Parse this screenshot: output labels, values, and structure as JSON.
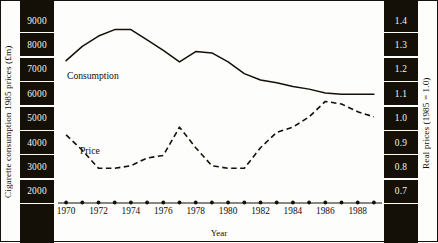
{
  "axes": {
    "left_title": "Cigarette consumption 1985 prices (£m)",
    "right_title": "Real prices (1985 = 1.0)",
    "x_title": "Year"
  },
  "labels": {
    "consumption": "Consumption",
    "price": "Price"
  },
  "ticks": {
    "left": [
      "9000",
      "8000",
      "7000",
      "6000",
      "5000",
      "4000",
      "3000",
      "2000"
    ],
    "right": [
      "1.4",
      "1.3",
      "1.2",
      "1.1",
      "1.0",
      "0.9",
      "0.8",
      "0.7"
    ],
    "x": [
      "1970",
      "1972",
      "1974",
      "1976",
      "1978",
      "1980",
      "1982",
      "1984",
      "1986",
      "1988"
    ]
  },
  "colors": {
    "ink": "#141008",
    "paper": "#fdfdfb",
    "tick_text": "#f6f3ec"
  },
  "chart_data": {
    "type": "line",
    "title": "",
    "xlabel": "Year",
    "ylabel": "Cigarette consumption 1985 prices (£m)",
    "y2label": "Real prices (1985 = 1.0)",
    "grid": false,
    "legend": "inline-labels",
    "xlim": [
      1969.5,
      1989.5
    ],
    "ylim": [
      1700,
      9350
    ],
    "y2lim": [
      0.665,
      1.435
    ],
    "x": [
      1970,
      1971,
      1972,
      1973,
      1974,
      1975,
      1976,
      1977,
      1978,
      1979,
      1980,
      1981,
      1982,
      1983,
      1984,
      1985,
      1986,
      1987,
      1988,
      1989
    ],
    "series": [
      {
        "name": "Consumption",
        "axis": "left",
        "style": "solid",
        "units": "£m at 1985 prices",
        "values": [
          7200,
          7750,
          8150,
          8400,
          8400,
          8000,
          7600,
          7150,
          7550,
          7500,
          7150,
          6700,
          6450,
          6350,
          6200,
          6100,
          5950,
          5900,
          5900,
          5900
        ]
      },
      {
        "name": "Price",
        "axis": "right",
        "style": "dashed",
        "units": "index, 1985 = 1.0",
        "values": [
          0.93,
          0.87,
          0.8,
          0.8,
          0.81,
          0.84,
          0.85,
          0.96,
          0.88,
          0.81,
          0.8,
          0.8,
          0.88,
          0.94,
          0.96,
          1.0,
          1.06,
          1.05,
          1.02,
          1.0
        ]
      }
    ],
    "baseline_markers": {
      "description": "filled dot marker drawn on the x-axis at each year",
      "x": [
        1970,
        1971,
        1972,
        1973,
        1974,
        1975,
        1976,
        1977,
        1978,
        1979,
        1980,
        1981,
        1982,
        1983,
        1984,
        1985,
        1986,
        1987,
        1988,
        1989
      ]
    }
  }
}
